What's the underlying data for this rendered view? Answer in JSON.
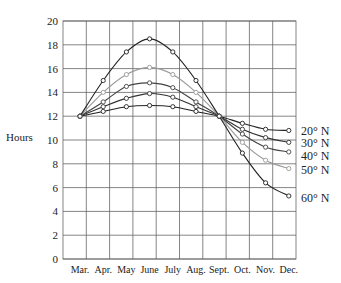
{
  "chart_data": {
    "type": "line",
    "title": "",
    "xlabel": "",
    "ylabel": "Hours",
    "ylim": [
      0,
      20
    ],
    "yticks": [
      0,
      2,
      4,
      6,
      8,
      10,
      12,
      14,
      16,
      18,
      20
    ],
    "grid": true,
    "legend_position": "right-inline",
    "categories": [
      "Mar.",
      "Apr.",
      "May",
      "June",
      "July",
      "Aug.",
      "Sept.",
      "Oct.",
      "Nov.",
      "Dec."
    ],
    "series": [
      {
        "name": "20° N",
        "color": "#222222",
        "values": [
          12.0,
          12.4,
          12.8,
          12.9,
          12.8,
          12.4,
          12.0,
          11.4,
          10.9,
          10.8
        ]
      },
      {
        "name": "30° N",
        "color": "#333333",
        "values": [
          12.0,
          12.8,
          13.5,
          13.9,
          13.6,
          12.8,
          12.0,
          10.9,
          10.2,
          9.8
        ]
      },
      {
        "name": "40° N",
        "color": "#444444",
        "values": [
          12.0,
          13.2,
          14.5,
          14.8,
          14.4,
          13.2,
          12.0,
          10.5,
          9.4,
          9.0
        ]
      },
      {
        "name": "50° N",
        "color": "#999999",
        "values": [
          12.0,
          14.0,
          15.5,
          16.1,
          15.5,
          14.0,
          12.0,
          9.8,
          8.3,
          7.6
        ]
      },
      {
        "name": "60° N",
        "color": "#222222",
        "values": [
          12.0,
          15.0,
          17.4,
          18.5,
          17.4,
          15.0,
          12.0,
          8.9,
          6.4,
          5.3
        ]
      }
    ]
  },
  "labels": {
    "ylabel": "Hours",
    "series_labels": [
      "20° N",
      "30° N",
      "40° N",
      "50° N",
      "60° N"
    ]
  }
}
